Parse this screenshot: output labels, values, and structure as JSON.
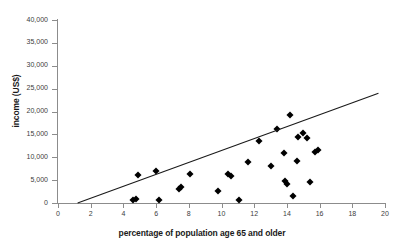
{
  "chart_data": {
    "type": "scatter",
    "title": "",
    "xlabel": "percentage of population age 65 and older",
    "ylabel": "income (US$)",
    "xlim": [
      0,
      20
    ],
    "ylim": [
      0,
      40000
    ],
    "grid": false,
    "legend": null,
    "xticks": [
      0,
      2,
      4,
      6,
      8,
      10,
      12,
      14,
      16,
      18,
      20
    ],
    "xtick_labels": [
      "0",
      "2",
      "4",
      "6",
      "8",
      "10",
      "12",
      "14",
      "16",
      "18",
      "20"
    ],
    "yticks": [
      0,
      5000,
      10000,
      15000,
      20000,
      25000,
      30000,
      35000,
      40000
    ],
    "ytick_labels": [
      "0",
      "5,000",
      "10,000",
      "15,000",
      "20,000",
      "25,000",
      "30,000",
      "35,000",
      "40,000"
    ],
    "marker": "diamond",
    "marker_color": "#000000",
    "axis_color": "#8c8c8c",
    "points": [
      {
        "x": 4.6,
        "y": 600
      },
      {
        "x": 4.8,
        "y": 900
      },
      {
        "x": 4.9,
        "y": 6200
      },
      {
        "x": 6.2,
        "y": 700
      },
      {
        "x": 6.0,
        "y": 6900
      },
      {
        "x": 7.4,
        "y": 3100
      },
      {
        "x": 7.5,
        "y": 3600
      },
      {
        "x": 8.1,
        "y": 6300
      },
      {
        "x": 9.8,
        "y": 2600
      },
      {
        "x": 10.4,
        "y": 6300
      },
      {
        "x": 10.6,
        "y": 5800
      },
      {
        "x": 11.1,
        "y": 600
      },
      {
        "x": 11.6,
        "y": 9000
      },
      {
        "x": 12.3,
        "y": 13500
      },
      {
        "x": 13.0,
        "y": 8000
      },
      {
        "x": 13.4,
        "y": 16100
      },
      {
        "x": 13.8,
        "y": 11000
      },
      {
        "x": 13.9,
        "y": 4700
      },
      {
        "x": 14.0,
        "y": 4100
      },
      {
        "x": 14.2,
        "y": 19300
      },
      {
        "x": 14.4,
        "y": 1600
      },
      {
        "x": 14.6,
        "y": 9100
      },
      {
        "x": 14.7,
        "y": 14500
      },
      {
        "x": 15.0,
        "y": 15400
      },
      {
        "x": 15.2,
        "y": 14100
      },
      {
        "x": 15.4,
        "y": 4500
      },
      {
        "x": 15.7,
        "y": 11200
      },
      {
        "x": 15.9,
        "y": 11600
      }
    ],
    "trendline": {
      "x0": 1.2,
      "y0": 0,
      "x1": 19.6,
      "y1": 24000,
      "color": "#1a1a1a"
    }
  }
}
